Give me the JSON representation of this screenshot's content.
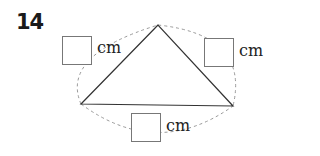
{
  "problem": {
    "number": "14",
    "shape": "triangle",
    "sides": [
      {
        "id": "left",
        "unit": "cm",
        "value": ""
      },
      {
        "id": "right",
        "unit": "cm",
        "value": ""
      },
      {
        "id": "bottom",
        "unit": "cm",
        "value": ""
      }
    ]
  },
  "colors": {
    "line": "#333333",
    "dashed": "#999999",
    "box_border": "#777777"
  }
}
